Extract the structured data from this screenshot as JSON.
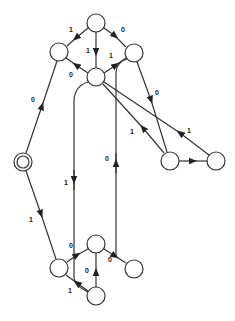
{
  "diagram": {
    "type": "state-transition-graph",
    "colors": {
      "stroke": "#333333",
      "background": "#ffffff",
      "text": "#222222"
    },
    "nodes": [
      {
        "id": "start",
        "x": 23,
        "y": 162,
        "start": true
      },
      {
        "id": "top",
        "x": 96,
        "y": 23
      },
      {
        "id": "upper-left",
        "x": 59,
        "y": 52
      },
      {
        "id": "upper-right",
        "x": 134,
        "y": 53
      },
      {
        "id": "center",
        "x": 96,
        "y": 77
      },
      {
        "id": "mid-right-a",
        "x": 170,
        "y": 161
      },
      {
        "id": "mid-right-b",
        "x": 216,
        "y": 161
      },
      {
        "id": "lower-left",
        "x": 59,
        "y": 268
      },
      {
        "id": "lower-center",
        "x": 96,
        "y": 244
      },
      {
        "id": "lower-right",
        "x": 134,
        "y": 269
      },
      {
        "id": "bottom",
        "x": 96,
        "y": 296
      }
    ],
    "edges": [
      {
        "from": "start",
        "to": "upper-left",
        "label": "0"
      },
      {
        "from": "start",
        "to": "lower-left",
        "label": "1"
      },
      {
        "from": "top",
        "to": "upper-left",
        "label": "1"
      },
      {
        "from": "top",
        "to": "upper-right",
        "label": "0"
      },
      {
        "from": "top",
        "to": "center",
        "label": "1"
      },
      {
        "from": "center",
        "to": "upper-left",
        "label": "0"
      },
      {
        "from": "center",
        "to": "upper-right",
        "label": "1"
      },
      {
        "from": "upper-right",
        "to": "mid-right-a",
        "label": "0"
      },
      {
        "from": "mid-right-a",
        "to": "center",
        "label": "1"
      },
      {
        "from": "mid-right-b",
        "to": "center",
        "label": "1"
      },
      {
        "from": "mid-right-a",
        "to": "mid-right-b",
        "label": ""
      },
      {
        "from": "center",
        "to": "bottom",
        "label": "1"
      },
      {
        "from": "lower-right",
        "to": "upper-right",
        "label": "0"
      },
      {
        "from": "lower-left",
        "to": "lower-center",
        "label": "0"
      },
      {
        "from": "lower-center",
        "to": "lower-right",
        "label": "0"
      },
      {
        "from": "bottom",
        "to": "lower-center",
        "label": "0"
      },
      {
        "from": "bottom",
        "to": "lower-left",
        "label": "1"
      }
    ],
    "labels": {
      "start_upperleft": "0",
      "start_lowerleft": "1",
      "top_upperleft": "1",
      "top_upperright": "0",
      "top_center": "1",
      "center_upperleft": "0",
      "center_upperright": "1",
      "upperright_midright": "0",
      "midrighta_center": "1",
      "midrightb_center": "1",
      "center_bottom_long": "1",
      "lowerright_up_long": "0",
      "lowerleft_lowercenter": "0",
      "lowercenter_lowerright": "0",
      "bottom_lowercenter": "0",
      "bottom_lowerleft": "1"
    }
  }
}
